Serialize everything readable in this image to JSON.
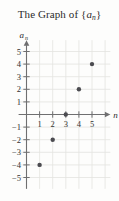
{
  "figure": {
    "title_prefix": "The Graph of {",
    "title_var": "a",
    "title_sub": "n",
    "title_suffix": "}",
    "background_color": "#fdfdfc",
    "grid_color": "#e3e3e0",
    "axis_color": "#6f6f70",
    "point_color": "#4b4b50",
    "text_color": "#2b2b2b"
  },
  "chart_data": {
    "type": "scatter",
    "xlabel": "n",
    "ylabel": "a_n",
    "x": [
      1,
      2,
      3,
      4,
      5
    ],
    "values": [
      -4,
      -2,
      0,
      2,
      4
    ],
    "points": [
      {
        "x": 1,
        "y": -4
      },
      {
        "x": 2,
        "y": -2
      },
      {
        "x": 3,
        "y": 0
      },
      {
        "x": 4,
        "y": 2
      },
      {
        "x": 5,
        "y": 4
      }
    ],
    "xlim": [
      -0.6,
      6.4
    ],
    "ylim": [
      -5.9,
      5.9
    ],
    "xticks": [
      1,
      2,
      3,
      4,
      5
    ],
    "yticks": [
      5,
      4,
      3,
      2,
      1,
      -1,
      -2,
      -3,
      -4,
      -5
    ],
    "xtick_labels": [
      "1",
      "2",
      "3",
      "4",
      "5"
    ],
    "ytick_labels": [
      "5",
      "4",
      "3",
      "2",
      "1",
      "−1",
      "−2",
      "−3",
      "−4",
      "−5"
    ],
    "grid": true,
    "legend": "none",
    "arrows": [
      "x-positive",
      "y-positive"
    ]
  }
}
